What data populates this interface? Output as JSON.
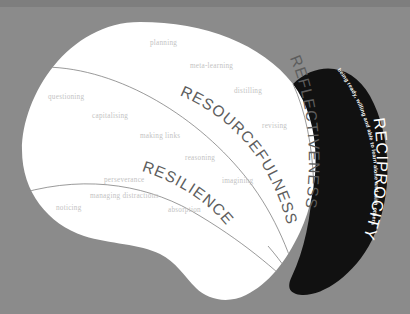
{
  "diagram": {
    "colors": {
      "background": "#8b8b8b",
      "top_band": "#7e7e7e",
      "blob_fill": "#ffffff",
      "reciprocity_fill": "#111111",
      "label_text": "#c3c3c3",
      "arc_text": "#5d5d5d",
      "arc_text_white": "#ffffff",
      "divider_stroke": "#6f6f6f"
    },
    "segments": [
      {
        "id": "resourcefulness",
        "name": "RESOURCEFULNESS",
        "style": "dark-on-white"
      },
      {
        "id": "resilience",
        "name": "RESILIENCE",
        "style": "dark-on-white"
      },
      {
        "id": "reflectiveness",
        "name": "REFLECTIVENESS",
        "style": "dark-on-white"
      },
      {
        "id": "reciprocity",
        "name": "RECIPROCITY",
        "style": "white-on-black"
      }
    ],
    "tagline": "being ready, willing and able to learn alone and with others",
    "capacities": [
      {
        "label": "planning",
        "x": 150,
        "y": 45,
        "segment": "reflectiveness"
      },
      {
        "label": "meta-learning",
        "x": 190,
        "y": 68,
        "segment": "reflectiveness"
      },
      {
        "label": "distilling",
        "x": 234,
        "y": 93,
        "segment": "reflectiveness"
      },
      {
        "label": "revising",
        "x": 262,
        "y": 128,
        "segment": "reflectiveness"
      },
      {
        "label": "questioning",
        "x": 48,
        "y": 99,
        "segment": "resourcefulness"
      },
      {
        "label": "capitalising",
        "x": 92,
        "y": 118,
        "segment": "resourcefulness"
      },
      {
        "label": "making links",
        "x": 140,
        "y": 138,
        "segment": "resourcefulness"
      },
      {
        "label": "reasoning",
        "x": 185,
        "y": 160,
        "segment": "resourcefulness"
      },
      {
        "label": "imagining",
        "x": 222,
        "y": 183,
        "segment": "resourcefulness"
      },
      {
        "label": "perseverance",
        "x": 104,
        "y": 182,
        "segment": "resilience"
      },
      {
        "label": "managing distractions",
        "x": 90,
        "y": 198,
        "segment": "resilience"
      },
      {
        "label": "noticing",
        "x": 56,
        "y": 210,
        "segment": "resilience"
      },
      {
        "label": "absorption",
        "x": 168,
        "y": 212,
        "segment": "resilience"
      }
    ]
  }
}
